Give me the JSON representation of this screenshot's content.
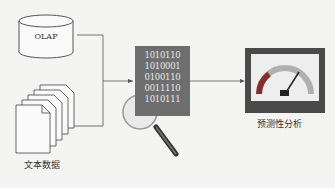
{
  "diagram": {
    "sources": [
      {
        "id": "olap",
        "label": "OLAP",
        "icon": "database-cylinder-icon"
      },
      {
        "id": "text",
        "label": "文本数据",
        "icon": "document-stack-icon"
      }
    ],
    "processor": {
      "icon": "binary-data-magnifier-icon",
      "binary_lines": [
        "1010110",
        "1010001",
        "0100110",
        "0011110",
        "1010111"
      ]
    },
    "output": {
      "label": "预测性分析",
      "icon": "gauge-meter-icon"
    },
    "colors": {
      "line": "#555555",
      "binary_bg": "#6e6e6e",
      "gauge_frame": "#4a4a4a",
      "gauge_red": "#8a2c2c",
      "gauge_arc": "#b0b0b0"
    }
  }
}
